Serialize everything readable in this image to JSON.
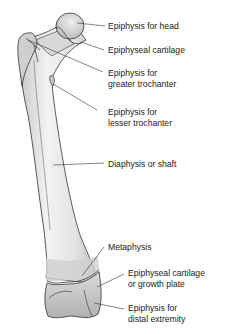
{
  "diagram": {
    "labels": [
      {
        "id": "epiphysis-head",
        "lines": [
          "Epiphysis for head"
        ]
      },
      {
        "id": "epiphyseal-cartilage-top",
        "lines": [
          "Epiphyseal cartilage"
        ]
      },
      {
        "id": "epiphysis-greater-trochanter",
        "lines": [
          "Epiphysis for",
          "greater trochanter"
        ]
      },
      {
        "id": "epiphysis-lesser-trochanter",
        "lines": [
          "Epiphysis for",
          "lesser trochanter"
        ]
      },
      {
        "id": "diaphysis",
        "lines": [
          "Diaphysis or shaft"
        ]
      },
      {
        "id": "metaphysis",
        "lines": [
          "Metaphysis"
        ]
      },
      {
        "id": "epiphyseal-cartilage-bottom",
        "lines": [
          "Epiphyseal cartilage",
          "or growth plate"
        ]
      },
      {
        "id": "epiphysis-distal",
        "lines": [
          "Epiphysis for",
          "distal extremity"
        ]
      }
    ]
  }
}
